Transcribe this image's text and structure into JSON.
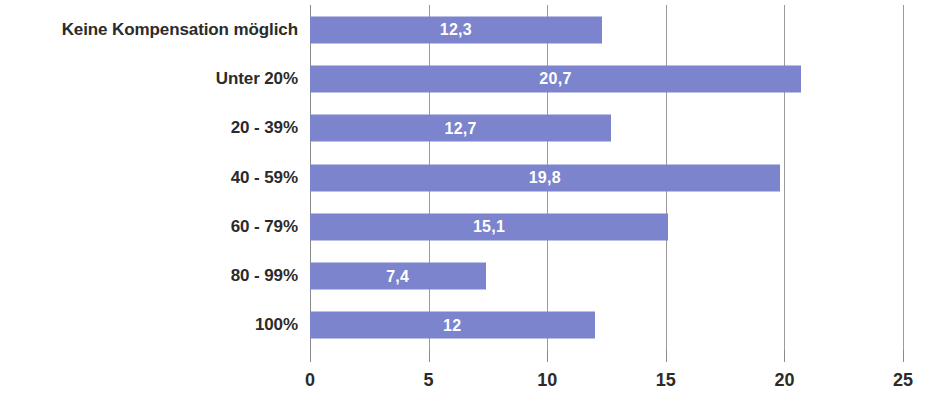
{
  "chart": {
    "background_color": "#ffffff",
    "bar_color": "#7b84cc",
    "gridline_color": "#9a9a9a",
    "label_color": "#2b2b2b",
    "value_label_color": "#ffffff"
  },
  "chart_data": {
    "type": "bar",
    "orientation": "horizontal",
    "title": "",
    "subtitle": "",
    "xlabel": "",
    "ylabel": "",
    "legend": [],
    "legend_position": "none",
    "grid": true,
    "grid_axis": "x",
    "xlim": [
      0,
      25
    ],
    "xticks": [
      "0",
      "5",
      "10",
      "15",
      "20",
      "25"
    ],
    "xtick_values": [
      0,
      5,
      10,
      15,
      20,
      25
    ],
    "categories": [
      "Keine Kompensation möglich",
      "Unter 20%",
      "20 - 39%",
      "40 - 59%",
      "60 - 79%",
      "80 - 99%",
      "100%"
    ],
    "values": [
      12.3,
      20.7,
      12.7,
      19.8,
      15.1,
      7.4,
      12
    ],
    "data_labels": [
      "12,3",
      "20,7",
      "12,7",
      "19,8",
      "15,1",
      "7,4",
      "12"
    ]
  }
}
